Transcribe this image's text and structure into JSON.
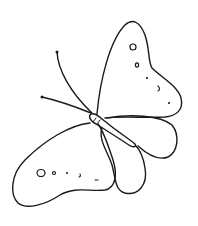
{
  "image": {
    "subject": "butterfly line drawing",
    "background": "#ffffff",
    "line_color": "#1a1a1a"
  },
  "parts": {
    "forewing_upper": "upper-right forewing with spots",
    "forewing_left": "large left wing with row of spots",
    "hindwing_right": "right hindwing",
    "hindwing_lower": "lower hindwing",
    "body": "body",
    "antennae": [
      "left antenna",
      "upper antenna"
    ]
  }
}
